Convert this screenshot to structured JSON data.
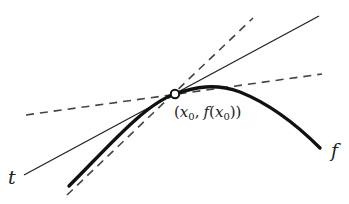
{
  "diagram": {
    "type": "tangent-line-illustration",
    "colors": {
      "stroke": "#1a1a1a",
      "dashed": "#444444",
      "background": "#ffffff"
    },
    "point": {
      "label_open": "(",
      "x_var": "x",
      "sub0": "0",
      "comma": ",",
      "f": "f",
      "open2": "(",
      "close": "))",
      "cx": 175,
      "cy": 94
    },
    "labels": {
      "tangent": "t",
      "function": "f"
    },
    "curve": {
      "name": "f",
      "start": [
        69,
        186
      ],
      "vertex": [
        215,
        86
      ],
      "end": [
        320,
        148
      ]
    },
    "tangent_line": {
      "name": "t",
      "start": [
        24,
        175
      ],
      "end": [
        319,
        16
      ],
      "style": "solid"
    },
    "secant_steep": {
      "start": [
        67,
        195
      ],
      "end": [
        253,
        18
      ],
      "style": "dashed"
    },
    "secant_shallow": {
      "start": [
        26,
        115
      ],
      "end": [
        322,
        74
      ],
      "style": "dashed"
    }
  }
}
